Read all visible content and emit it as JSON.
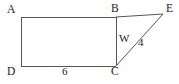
{
  "figure": {
    "type": "geometry-diagram",
    "background_color": "#ffffff",
    "line_color": "#555555",
    "text_color": "#1a1a1a",
    "vertices": {
      "A": {
        "label": "A",
        "x": 21,
        "y": 17
      },
      "B": {
        "label": "B",
        "x": 116,
        "y": 17
      },
      "C": {
        "label": "C",
        "x": 116,
        "y": 66
      },
      "D": {
        "label": "D",
        "x": 21,
        "y": 66
      },
      "E": {
        "label": "E",
        "x": 163,
        "y": 14
      }
    },
    "edges": [
      {
        "name": "AB",
        "from": "A",
        "to": "B"
      },
      {
        "name": "BC",
        "from": "B",
        "to": "C"
      },
      {
        "name": "CD",
        "from": "C",
        "to": "D"
      },
      {
        "name": "DA",
        "from": "D",
        "to": "A"
      },
      {
        "name": "BE",
        "from": "B",
        "to": "E"
      },
      {
        "name": "CE",
        "from": "C",
        "to": "E"
      }
    ],
    "measurements": {
      "side_dc": "6",
      "side_bc": "W",
      "side_ce": "4"
    }
  }
}
